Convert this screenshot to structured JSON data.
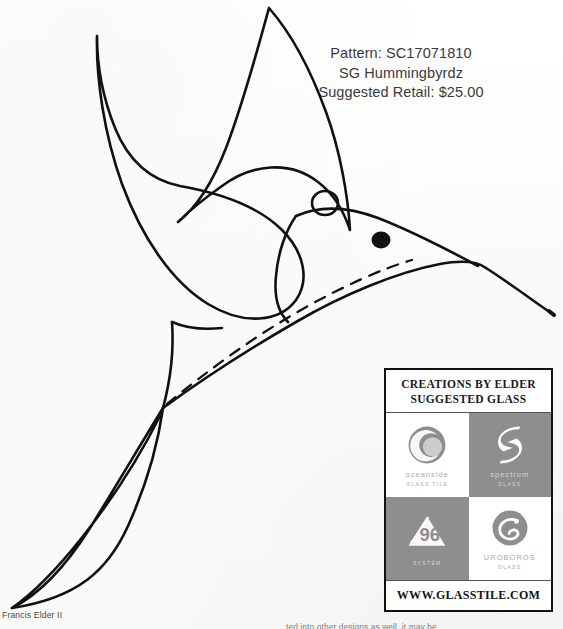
{
  "document": {
    "type": "stained-glass-pattern-sheet",
    "background_color": "#ffffff",
    "ink_color": "#111111"
  },
  "header": {
    "pattern_line": "Pattern: SC17071810",
    "title_line": "SG Hummingbyrdz",
    "price_line": "Suggested Retail: $25.00"
  },
  "drawing": {
    "subject": "hummingbird",
    "style": "line-art-outline",
    "parts": [
      "upper-wing",
      "lower-wing",
      "body",
      "head",
      "beak",
      "tail",
      "eye",
      "hanging-loop",
      "dashed-breast-line"
    ]
  },
  "glass_box": {
    "title_line_1": "CREATIONS BY ELDER",
    "title_line_2": "SUGGESTED GLASS",
    "url": "WWW.GLASSTILE.COM",
    "border_color": "#111111",
    "dark_cell_color": "#8e8e8e",
    "logos": [
      {
        "name": "oceanside",
        "wordmark": "oceanside",
        "sub": "GLASS TILE",
        "background": "light",
        "mark": "crescent-circle"
      },
      {
        "name": "spectrum",
        "wordmark": "spectrum",
        "sub": "GLASS",
        "background": "dark",
        "mark": "s-ribbon"
      },
      {
        "name": "system-96",
        "wordmark": "96",
        "sub": "SYSTEM",
        "background": "dark",
        "mark": "triangle-96"
      },
      {
        "name": "uroboros",
        "wordmark": "UROBOROS",
        "sub": "GLASS",
        "background": "light",
        "mark": "snake-circle"
      }
    ]
  },
  "footer": {
    "author": "Francis Elder II",
    "note": "ted into other designs as well, it may be"
  }
}
